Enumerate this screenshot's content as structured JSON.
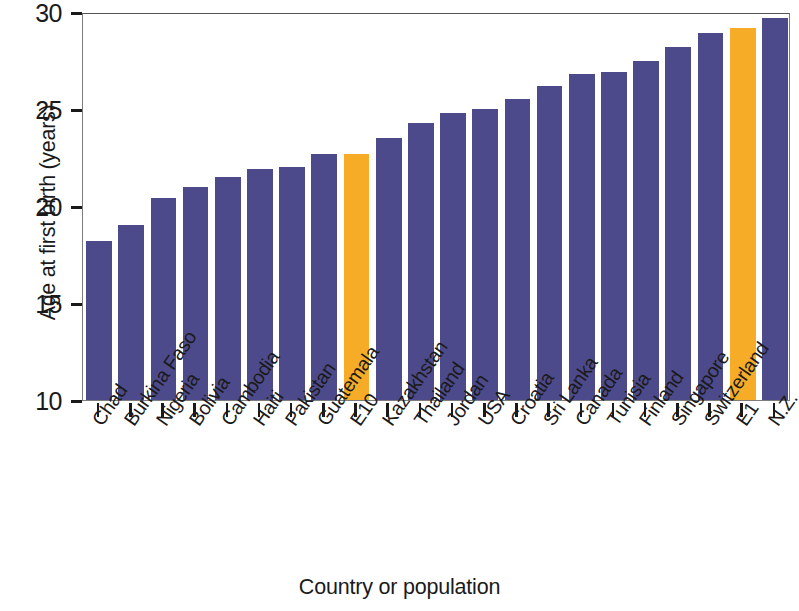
{
  "chart_data": {
    "type": "bar",
    "title": "",
    "subtitle": "",
    "xlabel": "Country or population",
    "ylabel": "Age at first birth (years)",
    "ylim": [
      10,
      30
    ],
    "yticks": [
      10,
      15,
      20,
      25,
      30
    ],
    "ytick_labels": [
      "10",
      "15",
      "20",
      "25",
      "30"
    ],
    "grid": false,
    "legend": null,
    "categories": [
      "Chad",
      "Burkina Faso",
      "Nigeria",
      "Bolivia",
      "Cambodia",
      "Haiti",
      "Pakistan",
      "Guatemala",
      "E10",
      "Kazakhstan",
      "Thailand",
      "Jordan",
      "USA",
      "Croatia",
      "Sri Lanka",
      "Canada",
      "Tunisia",
      "Finland",
      "Singapore",
      "Switzerland",
      "E1",
      "N.Z."
    ],
    "values": [
      18.2,
      19.0,
      20.4,
      21.0,
      21.5,
      21.9,
      22.0,
      22.7,
      22.7,
      23.5,
      24.3,
      24.8,
      25.0,
      25.5,
      26.2,
      26.8,
      26.9,
      27.5,
      28.2,
      28.9,
      29.2,
      29.7
    ],
    "bar_colors": [
      "#4d4a8b",
      "#4d4a8b",
      "#4d4a8b",
      "#4d4a8b",
      "#4d4a8b",
      "#4d4a8b",
      "#4d4a8b",
      "#4d4a8b",
      "#f6ac26",
      "#4d4a8b",
      "#4d4a8b",
      "#4d4a8b",
      "#4d4a8b",
      "#4d4a8b",
      "#4d4a8b",
      "#4d4a8b",
      "#4d4a8b",
      "#4d4a8b",
      "#4d4a8b",
      "#4d4a8b",
      "#f6ac26",
      "#4d4a8b"
    ],
    "highlight_color": "#f6ac26",
    "series_color": "#4d4a8b",
    "highlighted_categories": [
      "E10",
      "E1"
    ]
  }
}
